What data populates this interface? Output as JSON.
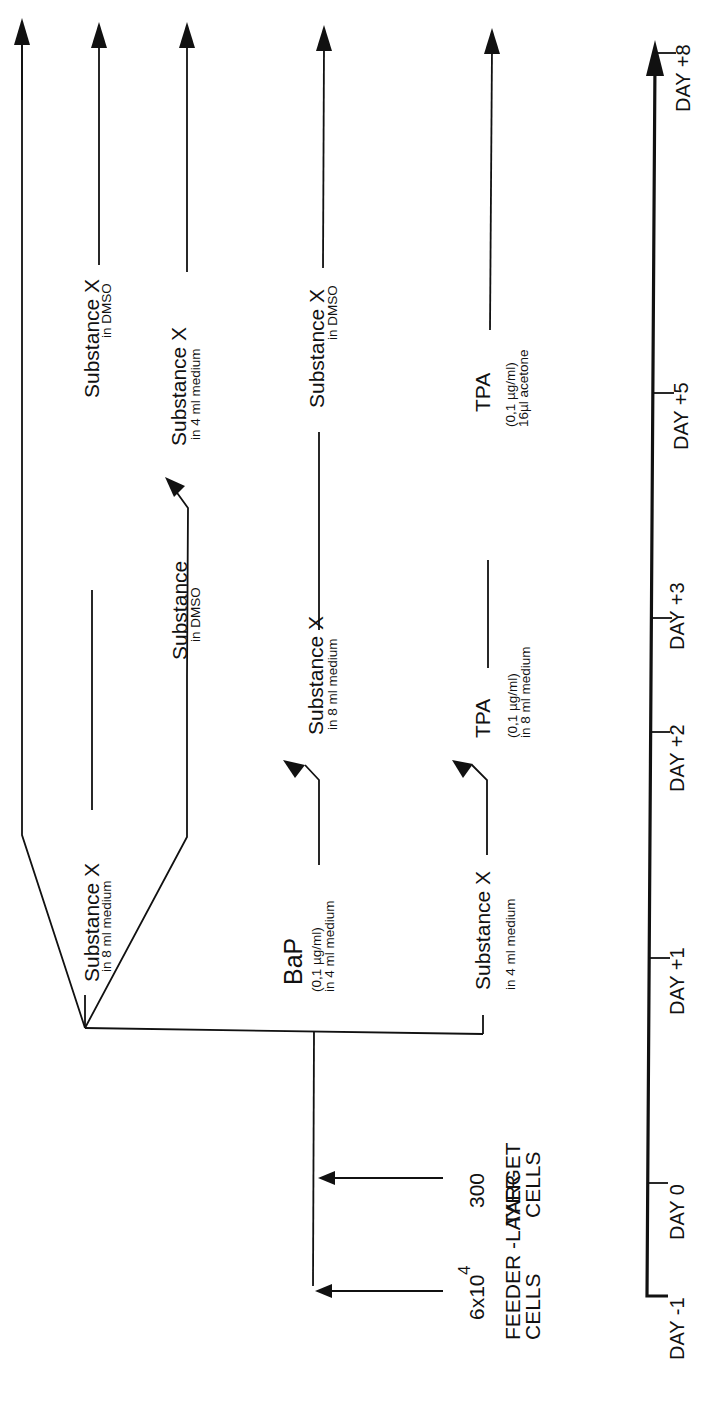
{
  "diagram": {
    "orientation": "rotated 90deg counter-clockwise",
    "inputs": {
      "feeder": {
        "count": "6x10",
        "exponent": "4",
        "label_line1": "FEEDER -LAYER",
        "label_line2": "CELLS"
      },
      "target": {
        "count": "300",
        "label_line1": "TARGET",
        "label_line2": "CELLS"
      }
    },
    "branches": [
      {
        "id": "branch-1",
        "steps": [
          {
            "label": "Substance X",
            "sub": "in 8 ml medium"
          },
          {
            "label": "Substance X",
            "sub": "in DMSO"
          }
        ]
      },
      {
        "id": "branch-2",
        "steps": [
          {
            "label": "Substance",
            "sub": "in DMSO"
          },
          {
            "label": "Substance X",
            "sub": "in 4 ml medium"
          }
        ]
      },
      {
        "id": "branch-3",
        "steps": [
          {
            "label": "BaP",
            "sub1": "(0,1 µg/ml)",
            "sub2": "in 4 ml medium"
          },
          {
            "label": "Substance X",
            "sub": "in 8 ml medium"
          },
          {
            "label": "Substance X",
            "sub": "in DMSO"
          }
        ]
      },
      {
        "id": "branch-4",
        "steps": [
          {
            "label": "Substance X",
            "sub": "in 4 ml medium"
          },
          {
            "label": "TPA",
            "sub1": "(0,1 µg/ml)",
            "sub2": "in 8 ml medium"
          },
          {
            "label": "TPA",
            "sub1": "(0,1 µg/ml)",
            "sub2": "16µl acetone"
          }
        ]
      }
    ],
    "timeline": {
      "ticks": [
        "DAY -1",
        "DAY 0",
        "DAY +1",
        "DAY +2",
        "DAY +3",
        "DAY +5",
        "DAY +8"
      ]
    }
  }
}
